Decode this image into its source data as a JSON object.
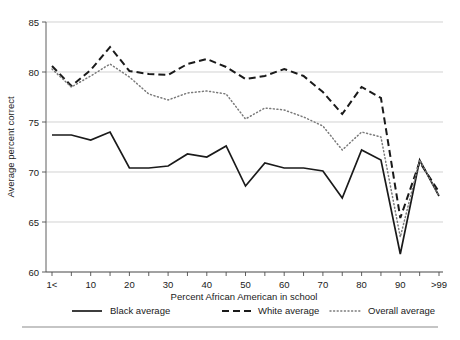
{
  "chart_data": {
    "type": "line",
    "title": "",
    "xlabel": "Percent African American in school",
    "ylabel": "Average percent correct",
    "xlim": [
      0,
      20
    ],
    "ylim": [
      60,
      85
    ],
    "yticks": [
      60,
      65,
      70,
      75,
      80,
      85
    ],
    "ytick_labels": [
      "60",
      "65",
      "70",
      "75",
      "80",
      "85"
    ],
    "xtick_labels": [
      "1<",
      "",
      "10",
      "",
      "20",
      "",
      "30",
      "",
      "40",
      "",
      "50",
      "",
      "60",
      "",
      "70",
      "",
      "80",
      "",
      "90",
      "",
      ">99"
    ],
    "xtick_major_labels": [
      "1<",
      "10",
      "20",
      "30",
      "40",
      "50",
      "60",
      "70",
      "80",
      "90",
      ">99"
    ],
    "categories": [
      "1<",
      "5",
      "10",
      "15",
      "20",
      "25",
      "30",
      "35",
      "40",
      "45",
      "50",
      "55",
      "60",
      "65",
      "70",
      "75",
      "80",
      "85",
      "90",
      "95",
      ">99"
    ],
    "grid": "horizontal",
    "legend_position": "bottom",
    "series": [
      {
        "name": "Black average",
        "style": "solid",
        "values": [
          73.7,
          73.7,
          73.2,
          74.0,
          70.4,
          70.4,
          70.6,
          71.8,
          71.5,
          72.6,
          68.6,
          70.9,
          70.4,
          70.4,
          70.1,
          67.4,
          72.2,
          71.2,
          61.8,
          71.2,
          67.6
        ]
      },
      {
        "name": "White average",
        "style": "dashed",
        "values": [
          80.6,
          78.6,
          80.2,
          82.5,
          80.1,
          79.8,
          79.7,
          80.8,
          81.3,
          80.5,
          79.3,
          79.6,
          80.3,
          79.6,
          78.0,
          75.8,
          78.5,
          77.4,
          65.4,
          71.0,
          68.0
        ]
      },
      {
        "name": "Overall average",
        "style": "dotted",
        "values": [
          80.3,
          78.5,
          79.6,
          80.8,
          79.5,
          77.8,
          77.2,
          77.9,
          78.1,
          77.8,
          75.3,
          76.4,
          76.2,
          75.5,
          74.6,
          72.2,
          74.0,
          73.5,
          63.5,
          71.2,
          67.6
        ]
      }
    ]
  },
  "legend": {
    "items": [
      {
        "label": "Black average",
        "style": "solid"
      },
      {
        "label": "White average",
        "style": "dashed"
      },
      {
        "label": "Overall average",
        "style": "dotted"
      }
    ]
  }
}
